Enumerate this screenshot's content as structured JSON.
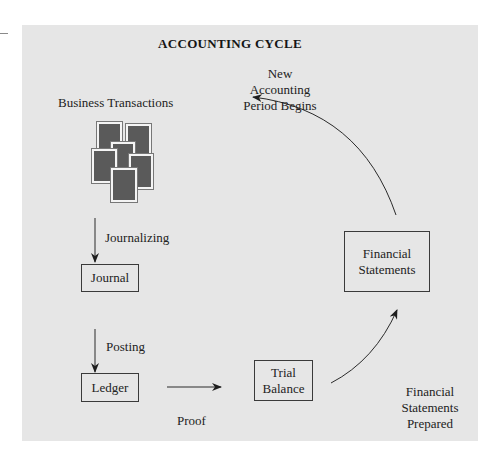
{
  "diagram": {
    "title": "ACCOUNTING CYCLE",
    "colors": {
      "panel_background": "#e6e6e6",
      "page_background": "#ffffff",
      "line_color": "#2a2a2a",
      "document_fill": "#5a5a5a"
    },
    "labels": {
      "business_transactions": "Business Transactions",
      "new_period_line1": "New",
      "new_period_line2": "Accounting",
      "new_period_line3": "Period Begins",
      "journalizing": "Journalizing",
      "posting": "Posting",
      "proof": "Proof",
      "fs_prepared_line1": "Financial",
      "fs_prepared_line2": "Statements",
      "fs_prepared_line3": "Prepared"
    },
    "boxes": {
      "journal": "Journal",
      "ledger": "Ledger",
      "trial_balance_line1": "Trial",
      "trial_balance_line2": "Balance",
      "financial_statements_line1": "Financial",
      "financial_statements_line2": "Statements"
    },
    "icons": {
      "documents": "stacked-documents-icon"
    },
    "flow": [
      "Business Transactions",
      "Journal",
      "Ledger",
      "Trial Balance",
      "Financial Statements",
      "New Accounting Period Begins"
    ]
  }
}
